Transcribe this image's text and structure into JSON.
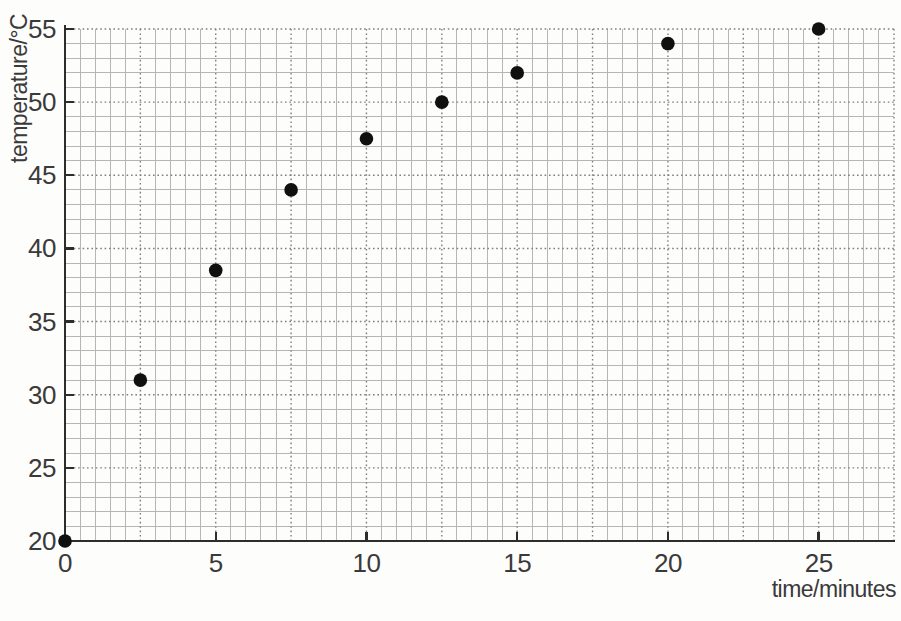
{
  "chart_data": {
    "type": "scatter",
    "xlabel": "time/minutes",
    "ylabel": "temperature/°C",
    "xlim": [
      0,
      27.5
    ],
    "ylim": [
      20,
      55
    ],
    "x_ticks": [
      0,
      5,
      10,
      15,
      20,
      25
    ],
    "y_ticks": [
      20,
      25,
      30,
      35,
      40,
      45,
      50,
      55
    ],
    "minor_grid_step": {
      "x": 0.5,
      "y": 1
    },
    "major_grid_step": {
      "x": 2.5,
      "y": 5
    },
    "grid": true,
    "legend": false,
    "points": [
      {
        "x": 0,
        "y": 20
      },
      {
        "x": 2.5,
        "y": 31
      },
      {
        "x": 5,
        "y": 38.5
      },
      {
        "x": 7.5,
        "y": 44
      },
      {
        "x": 10,
        "y": 47.5
      },
      {
        "x": 12.5,
        "y": 50
      },
      {
        "x": 15,
        "y": 52
      },
      {
        "x": 20,
        "y": 54
      },
      {
        "x": 25,
        "y": 55
      }
    ],
    "colors": {
      "point": "#101010",
      "axis": "#2d2d2d",
      "minor_grid": "#b6b6b6",
      "major_grid": "#7f7f7f",
      "text": "#3a3a3a",
      "background": "#fdfdfc"
    }
  }
}
